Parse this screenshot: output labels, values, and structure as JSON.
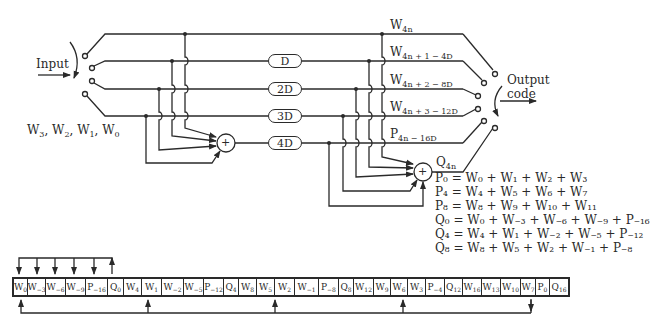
{
  "diagram": {
    "input_label": "Input",
    "input_words": "W3, W2, W1, W0",
    "output_label_line1": "Output",
    "output_label_line2": "code",
    "delays": [
      "D",
      "2D",
      "3D",
      "4D"
    ],
    "line_labels": [
      {
        "base": "W",
        "sub": "4n"
      },
      {
        "base": "W",
        "sub": "4n + 1 − 4D"
      },
      {
        "base": "W",
        "sub": "4n + 2 − 8D"
      },
      {
        "base": "W",
        "sub": "4n + 3 − 12D"
      },
      {
        "base": "P",
        "sub": "4n − 16D"
      },
      {
        "base": "Q",
        "sub": "4n"
      }
    ],
    "adder_symbol": "+",
    "equations": [
      "P₀ = W₀ + W₁ + W₂ + W₃",
      "P₄ = W₄ + W₅ + W₆ + W₇",
      "P₈ = W₈ + W₉ + W₁₀ + W₁₁",
      "Q₀ = W₀ + W₋₃ + W₋₆ + W₋₉ + P₋₁₆",
      "Q₄ = W₄ + W₁ + W₋₂ + W₋₅ + P₋₁₂",
      "Q₈ = W₈ + W₅ + W₂ + W₋₁ + P₋₈"
    ],
    "register_cells": [
      {
        "base": "W",
        "sub": "0",
        "w": 14
      },
      {
        "base": "W",
        "sub": "−3",
        "w": 18
      },
      {
        "base": "W",
        "sub": "−6",
        "w": 20
      },
      {
        "base": "W",
        "sub": "−9",
        "w": 20
      },
      {
        "base": "P",
        "sub": "−16",
        "w": 22
      },
      {
        "base": "Q",
        "sub": "0",
        "w": 16
      },
      {
        "base": "W",
        "sub": "4",
        "w": 18
      },
      {
        "base": "W",
        "sub": "1",
        "w": 20
      },
      {
        "base": "W",
        "sub": "−2",
        "w": 22
      },
      {
        "base": "W",
        "sub": "−5",
        "w": 20
      },
      {
        "base": "P",
        "sub": "−12",
        "w": 20
      },
      {
        "base": "Q",
        "sub": "4",
        "w": 15
      },
      {
        "base": "W",
        "sub": "8",
        "w": 18
      },
      {
        "base": "W",
        "sub": "5",
        "w": 18
      },
      {
        "base": "W",
        "sub": "2",
        "w": 20
      },
      {
        "base": "W",
        "sub": "−1",
        "w": 24
      },
      {
        "base": "P",
        "sub": "−8",
        "w": 20
      },
      {
        "base": "Q",
        "sub": "8",
        "w": 15
      },
      {
        "base": "W",
        "sub": "12",
        "w": 20
      },
      {
        "base": "W",
        "sub": "9",
        "w": 17
      },
      {
        "base": "W",
        "sub": "6",
        "w": 17
      },
      {
        "base": "W",
        "sub": "3",
        "w": 18
      },
      {
        "base": "P",
        "sub": "−4",
        "w": 19
      },
      {
        "base": "Q",
        "sub": "12",
        "w": 18
      },
      {
        "base": "W",
        "sub": "16",
        "w": 19
      },
      {
        "base": "W",
        "sub": "13",
        "w": 19
      },
      {
        "base": "W",
        "sub": "10",
        "w": 20
      },
      {
        "base": "W",
        "sub": "7",
        "w": 15
      },
      {
        "base": "P",
        "sub": "0",
        "w": 14
      },
      {
        "base": "Q",
        "sub": "16",
        "w": 18
      }
    ]
  }
}
